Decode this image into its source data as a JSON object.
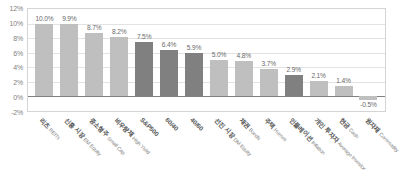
{
  "chart_data": {
    "type": "bar",
    "title": "",
    "xlabel": "",
    "ylabel": "",
    "ylim": [
      -2,
      12
    ],
    "grid": true,
    "legend": "none",
    "yticks": [
      "12%",
      "10%",
      "8%",
      "6%",
      "4%",
      "2%",
      "0%",
      "-2%"
    ],
    "ytick_values": [
      12,
      10,
      8,
      6,
      4,
      2,
      0,
      -2
    ],
    "categories": [
      "리츠 REITs",
      "신흥 시장 EM Equity",
      "중소형주 Small Cap",
      "비우량채 High Yield",
      "S&P500",
      "60/40",
      "40/60",
      "선진 시장 DM Equity",
      "채권 Bonds",
      "주택 Homes",
      "인플레이션 Inflation",
      "개인 투자자 Average Investor",
      "현금 Cash",
      "원자재 Commodity"
    ],
    "categories_ko": [
      "리츠",
      "신흥 시장",
      "중소형주",
      "비우량채",
      "S&P500",
      "60/40",
      "40/60",
      "선진 시장",
      "채권",
      "주택",
      "인플레이션",
      "개인 투자자",
      "현금",
      "원자재"
    ],
    "categories_en": [
      "REITs",
      "EM Equity",
      "Small Cap",
      "High Yield",
      "",
      "",
      "",
      "DM Equity",
      "Bonds",
      "Homes",
      "Inflation",
      "Average Investor",
      "Cash",
      "Commodity"
    ],
    "values": [
      10.0,
      9.9,
      8.7,
      8.2,
      7.5,
      6.4,
      5.9,
      5.0,
      4.8,
      3.7,
      2.9,
      2.1,
      1.4,
      -0.5
    ],
    "value_labels": [
      "10.0%",
      "9.9%",
      "8.7%",
      "8.2%",
      "7.5%",
      "6.4%",
      "5.9%",
      "5.0%",
      "4.8%",
      "3.7%",
      "2.9%",
      "2.1%",
      "1.4%",
      "-0.5%"
    ],
    "bar_styles": [
      "light",
      "light",
      "light",
      "light",
      "dark",
      "dark",
      "dark",
      "light",
      "light",
      "light",
      "dark",
      "light",
      "light",
      "light"
    ],
    "colors": {
      "light_bar": "#bfbfbf",
      "dark_bar": "#808080",
      "gridline": "#e2e2e2",
      "zeroline": "#808080",
      "frame": "#d4d4d4",
      "tick_text": "#808080",
      "label_text": "#6a6a6a",
      "background": "#ffffff"
    }
  }
}
